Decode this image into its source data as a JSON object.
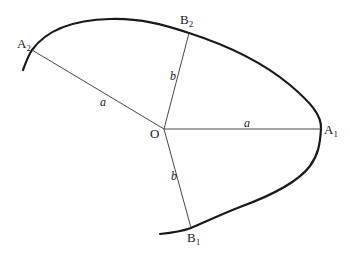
{
  "diagram": {
    "points": {
      "O": {
        "label": "O",
        "sub": "",
        "x": 164,
        "y": 129
      },
      "A1": {
        "label": "A",
        "sub": "1",
        "x": 321,
        "y": 129
      },
      "A2": {
        "label": "A",
        "sub": "2",
        "x": 32,
        "y": 50
      },
      "B1": {
        "label": "B",
        "sub": "1",
        "x": 191,
        "y": 228
      },
      "B2": {
        "label": "B",
        "sub": "2",
        "x": 189,
        "y": 33
      }
    },
    "segments": [
      {
        "from": "O",
        "to": "A1",
        "label": "a"
      },
      {
        "from": "O",
        "to": "A2",
        "label": "a"
      },
      {
        "from": "O",
        "to": "B1",
        "label": "b"
      },
      {
        "from": "O",
        "to": "B2",
        "label": "b"
      }
    ],
    "segment_labels": {
      "OA1": "a",
      "OA2": "a",
      "OB1": "b",
      "OB2": "b"
    },
    "colors": {
      "curve": "#1a1a1a",
      "lines": "#333333",
      "background": "#ffffff"
    }
  }
}
